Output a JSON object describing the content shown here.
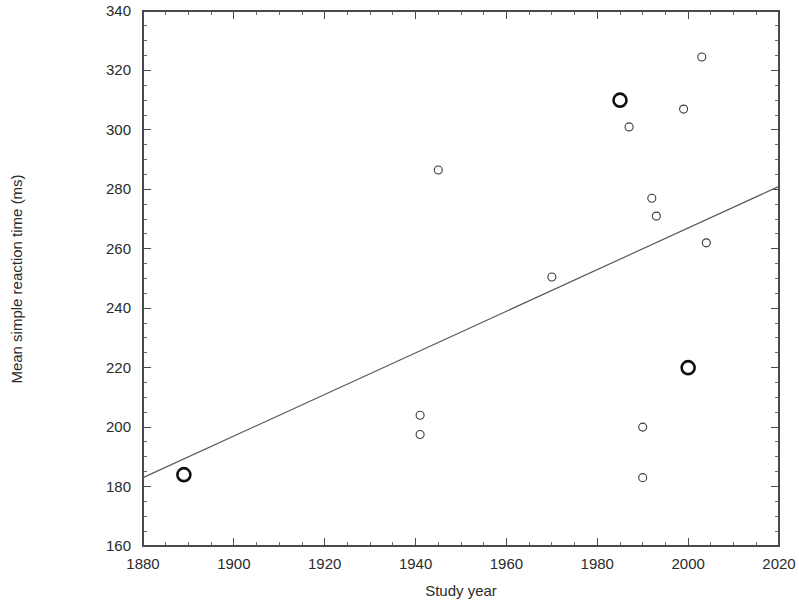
{
  "chart_data": {
    "type": "scatter",
    "title": "",
    "xlabel": "Study year",
    "ylabel": "Mean simple reaction time (ms)",
    "xlim": [
      1880,
      2020
    ],
    "ylim": [
      160,
      340
    ],
    "x_ticks": [
      1880,
      1900,
      1920,
      1940,
      1960,
      1980,
      2000,
      2020
    ],
    "y_ticks": [
      160,
      180,
      200,
      220,
      240,
      260,
      280,
      300,
      320,
      340
    ],
    "x_minor_step": 5,
    "y_minor_step": 5,
    "grid": false,
    "legend": "none",
    "series": [
      {
        "name": "historical-highlighted",
        "marker": "bold-open-circle",
        "points": [
          {
            "x": 1889,
            "y": 184
          },
          {
            "x": 1985,
            "y": 310
          },
          {
            "x": 2000,
            "y": 220
          }
        ]
      },
      {
        "name": "study-means",
        "marker": "small-open-circle",
        "points": [
          {
            "x": 1941,
            "y": 204
          },
          {
            "x": 1941,
            "y": 197.5
          },
          {
            "x": 1945,
            "y": 286.5
          },
          {
            "x": 1970,
            "y": 250.5
          },
          {
            "x": 1987,
            "y": 301
          },
          {
            "x": 1990,
            "y": 200
          },
          {
            "x": 1990,
            "y": 183
          },
          {
            "x": 1992,
            "y": 277
          },
          {
            "x": 1993,
            "y": 271
          },
          {
            "x": 1999,
            "y": 307
          },
          {
            "x": 2003,
            "y": 324.5
          },
          {
            "x": 2004,
            "y": 262
          }
        ]
      }
    ],
    "trend_line": {
      "name": "regression-line",
      "x1": 1880,
      "y1": 183,
      "x2": 2020,
      "y2": 281
    },
    "colors": {
      "axis": "#4a4a4a",
      "marker": "#3a3a3a",
      "marker_bold": "#101010",
      "trend": "#5a5a5a",
      "background": "#ffffff",
      "text": "#2b2b2b"
    }
  }
}
